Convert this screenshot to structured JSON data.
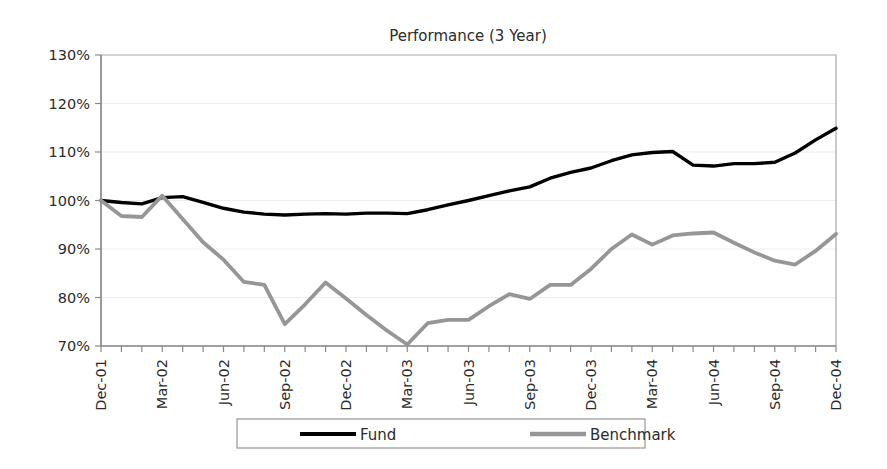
{
  "chart_data": {
    "type": "line",
    "title": "Performance (3 Year)",
    "xlabel": "",
    "ylabel": "",
    "ylim": [
      70,
      130
    ],
    "ytick_values": [
      70,
      80,
      90,
      100,
      110,
      120,
      130
    ],
    "ytick_labels": [
      "70%",
      "80%",
      "90%",
      "100%",
      "110%",
      "120%",
      "130%"
    ],
    "grid": true,
    "legend_position": "bottom",
    "categories": [
      "Dec-01",
      "Jan-02",
      "Feb-02",
      "Mar-02",
      "Apr-02",
      "May-02",
      "Jun-02",
      "Jul-02",
      "Aug-02",
      "Sep-02",
      "Oct-02",
      "Nov-02",
      "Dec-02",
      "Jan-03",
      "Feb-03",
      "Mar-03",
      "Apr-03",
      "May-03",
      "Jun-03",
      "Jul-03",
      "Aug-03",
      "Sep-03",
      "Oct-03",
      "Nov-03",
      "Dec-03",
      "Jan-04",
      "Feb-04",
      "Mar-04",
      "Apr-04",
      "May-04",
      "Jun-04",
      "Jul-04",
      "Aug-04",
      "Sep-04",
      "Oct-04",
      "Nov-04",
      "Dec-04"
    ],
    "xtick_labels": [
      "Dec-01",
      "Mar-02",
      "Jun-02",
      "Sep-02",
      "Dec-02",
      "Mar-03",
      "Jun-03",
      "Sep-03",
      "Dec-03",
      "Mar-04",
      "Jun-04",
      "Sep-04",
      "Dec-04"
    ],
    "xtick_indices": [
      0,
      3,
      6,
      9,
      12,
      15,
      18,
      21,
      24,
      27,
      30,
      33,
      36
    ],
    "series": [
      {
        "name": "Fund",
        "color": "#000000",
        "width": 3.4,
        "values": [
          100.0,
          99.6,
          99.3,
          100.6,
          100.8,
          99.6,
          98.4,
          97.6,
          97.2,
          97.0,
          97.2,
          97.3,
          97.2,
          97.4,
          97.4,
          97.3,
          98.1,
          99.1,
          100.0,
          101.0,
          102.0,
          102.8,
          104.6,
          105.8,
          106.7,
          108.2,
          109.4,
          109.9,
          110.1,
          107.3,
          107.1,
          107.6,
          107.6,
          107.9,
          109.8,
          112.5,
          114.9
        ]
      },
      {
        "name": "Benchmark",
        "color": "#969696",
        "width": 3.8,
        "values": [
          100.0,
          96.8,
          96.6,
          101.0,
          96.2,
          91.4,
          87.8,
          83.2,
          82.6,
          74.5,
          78.6,
          83.1,
          79.8,
          76.4,
          73.2,
          70.3,
          74.7,
          75.4,
          75.4,
          78.2,
          80.7,
          79.7,
          82.6,
          82.6,
          85.9,
          90.0,
          93.0,
          90.9,
          92.8,
          93.2,
          93.4,
          91.3,
          89.3,
          87.6,
          86.8,
          89.6,
          93.1
        ]
      }
    ]
  },
  "legend": {
    "entries": [
      {
        "label": "Fund",
        "color": "#000000"
      },
      {
        "label": "Benchmark",
        "color": "#969696"
      }
    ]
  }
}
